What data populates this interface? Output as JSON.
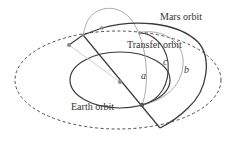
{
  "diagram": {
    "labels": {
      "mars_orbit": "Mars orbit",
      "transfer_orbit": "Transfer orbit",
      "earth_orbit": "Earth orbit",
      "curve_a": "a",
      "curve_b": "b",
      "curve_c": "c"
    },
    "colors": {
      "dark_line": "#3a3a3a",
      "gray_line": "#a0a0a0",
      "light_line": "#cfcfcf",
      "dot": "#8a8a8a",
      "background": "#ffffff"
    }
  }
}
